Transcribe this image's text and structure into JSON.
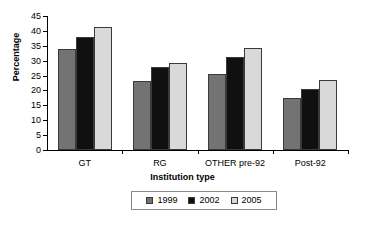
{
  "chart_data": {
    "type": "bar",
    "title": "",
    "xlabel": "Institution type",
    "ylabel": "Percentage",
    "categories": [
      "GT",
      "RG",
      "OTHER pre-92",
      "Post-92"
    ],
    "series": [
      {
        "name": "1999",
        "color": "#737373",
        "values": [
          34,
          23.2,
          25.4,
          17.5
        ]
      },
      {
        "name": "2002",
        "color": "#101010",
        "values": [
          38,
          28,
          31.3,
          20.4
        ]
      },
      {
        "name": "2005",
        "color": "#d9d9d9",
        "values": [
          41.2,
          29.1,
          34.2,
          23.4
        ]
      }
    ],
    "ylim": [
      0,
      45
    ],
    "yticks": [
      0,
      5,
      10,
      15,
      20,
      25,
      30,
      35,
      40,
      45
    ],
    "ytick_labels": [
      "0",
      "5",
      "10",
      "15",
      "20",
      "25",
      "30",
      "35",
      "40",
      "45"
    ],
    "grid": false,
    "legend_position": "bottom"
  }
}
